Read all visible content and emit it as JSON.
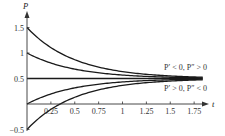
{
  "chart_data": {
    "type": "line",
    "title": "",
    "xlabel": "t",
    "ylabel": "P",
    "xlim": [
      0,
      1.85
    ],
    "ylim": [
      -0.5,
      1.65
    ],
    "grid": false,
    "x_ticks": [
      0.25,
      0.5,
      0.75,
      1,
      1.25,
      1.5,
      1.75
    ],
    "x_tick_labels": [
      "0.25",
      "0.5",
      "0.75",
      "1",
      "1.25",
      "1.5",
      "1.75"
    ],
    "y_ticks": [
      -0.5,
      0.5,
      1,
      1.5
    ],
    "y_tick_labels": [
      "−0.5",
      "0.5",
      "1",
      "1.5"
    ],
    "equilibrium": 0.5,
    "decay_rate": 2,
    "series": [
      {
        "name": "P(0)=1.5",
        "initial": 1.5
      },
      {
        "name": "P(0)=1",
        "initial": 1.0
      },
      {
        "name": "P(0)=0.5",
        "initial": 0.5
      },
      {
        "name": "P(0)=0",
        "initial": 0.0
      },
      {
        "name": "P(0)=-0.5",
        "initial": -0.5
      }
    ],
    "annotations": [
      {
        "text": "P′ < 0, P″ > 0",
        "region": "above equilibrium"
      },
      {
        "text": "P′ > 0, P″ < 0",
        "region": "below equilibrium"
      }
    ]
  },
  "labels": {
    "y_axis": "P",
    "x_axis": "t",
    "annot_upper": "P′ < 0, P″ > 0",
    "annot_lower": "P′ > 0, P″ < 0"
  }
}
